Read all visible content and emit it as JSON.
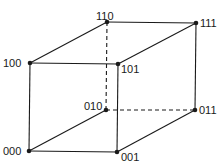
{
  "diagram": {
    "colors": {
      "stroke": "#1a1a1a",
      "background": "#ffffff"
    },
    "vertices": [
      {
        "id": "000",
        "label": "000",
        "x": 29,
        "y": 151
      },
      {
        "id": "001",
        "label": "001",
        "x": 117,
        "y": 152
      },
      {
        "id": "010",
        "label": "010",
        "x": 106,
        "y": 110
      },
      {
        "id": "011",
        "label": "011",
        "x": 195,
        "y": 110
      },
      {
        "id": "100",
        "label": "100",
        "x": 30,
        "y": 63
      },
      {
        "id": "101",
        "label": "101",
        "x": 118,
        "y": 64
      },
      {
        "id": "110",
        "label": "110",
        "x": 107,
        "y": 22
      },
      {
        "id": "111",
        "label": "111",
        "x": 196,
        "y": 23
      }
    ],
    "edges": [
      {
        "from": "000",
        "to": "001",
        "style": "solid"
      },
      {
        "from": "000",
        "to": "100",
        "style": "solid"
      },
      {
        "from": "000",
        "to": "010",
        "style": "solid"
      },
      {
        "from": "001",
        "to": "101",
        "style": "solid"
      },
      {
        "from": "001",
        "to": "011",
        "style": "solid"
      },
      {
        "from": "100",
        "to": "101",
        "style": "solid"
      },
      {
        "from": "100",
        "to": "110",
        "style": "solid"
      },
      {
        "from": "101",
        "to": "111",
        "style": "solid"
      },
      {
        "from": "110",
        "to": "111",
        "style": "solid"
      },
      {
        "from": "111",
        "to": "011",
        "style": "solid"
      },
      {
        "from": "110",
        "to": "010",
        "style": "dashed"
      },
      {
        "from": "010",
        "to": "011",
        "style": "dashed"
      }
    ]
  }
}
